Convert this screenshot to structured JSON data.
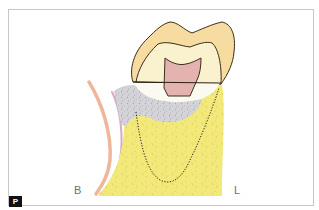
{
  "figure": {
    "badge": "P",
    "labels": {
      "buccal": "B",
      "lingual": "L"
    },
    "colors": {
      "enamel": "#f6dca0",
      "dentin": "#faf2cf",
      "pulp": "#e4b3b0",
      "bone": "#f2e97a",
      "granulation_tissue": "#c9c9cf",
      "gingiva_outer": "#efb69c",
      "gingiva_inner": "#d9a8c4",
      "outline": "#3a2e1c",
      "frame_border": "#c8c8c8",
      "badge_bg": "#111111"
    }
  }
}
